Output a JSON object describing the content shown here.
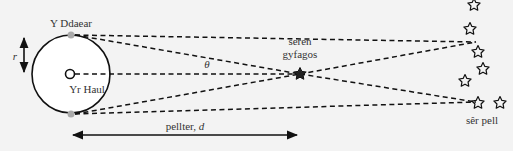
{
  "labels": {
    "earth": "Y Ddaear",
    "sun": "Yr Haul",
    "radius": "r",
    "angle": "θ",
    "nearby_star_line1": "seren",
    "nearby_star_line2": "gyfagos",
    "distant_stars": "sêr pell",
    "distance_word": "pellter, ",
    "distance_symbol": "d"
  },
  "colors": {
    "background": "#f3f3f3",
    "line": "#111111",
    "earth_dot": "#aaaaaa",
    "text": "#333333"
  }
}
